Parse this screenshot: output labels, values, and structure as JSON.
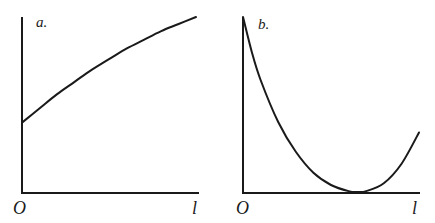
{
  "figure": {
    "background": "#ffffff",
    "ink_color": "#1a1a1a"
  },
  "chart_data": [
    {
      "type": "line",
      "panel_label": "a.",
      "title": "",
      "xlabel": "",
      "ylabel": "",
      "x_tick_labels": [
        "O",
        "l"
      ],
      "xlim": [
        0,
        1
      ],
      "ylim": [
        0,
        1
      ],
      "grid": false,
      "legend": null,
      "description": "Monotonically increasing concave curve starting at y-intercept about 0.4 and rising to about 1.0 at x = 1",
      "series": [
        {
          "name": "curve-a",
          "x": [
            0,
            0.1,
            0.2,
            0.3,
            0.4,
            0.5,
            0.6,
            0.7,
            0.8,
            0.9,
            1.0
          ],
          "y": [
            0.4,
            0.48,
            0.56,
            0.63,
            0.7,
            0.76,
            0.82,
            0.87,
            0.92,
            0.96,
            1.0
          ]
        }
      ]
    },
    {
      "type": "line",
      "panel_label": "b.",
      "title": "",
      "xlabel": "",
      "ylabel": "",
      "x_tick_labels": [
        "O",
        "l"
      ],
      "xlim": [
        0,
        1
      ],
      "ylim": [
        0,
        1
      ],
      "grid": false,
      "legend": null,
      "description": "U-shaped convex curve starting at maximum 1.0 at x = 0, decreasing to a minimum of 0 near x = 0.65, rising to about 0.34 at x = 1",
      "series": [
        {
          "name": "curve-b",
          "x": [
            0,
            0.05,
            0.1,
            0.2,
            0.3,
            0.4,
            0.5,
            0.6,
            0.65,
            0.7,
            0.8,
            0.9,
            1.0
          ],
          "y": [
            1.0,
            0.8,
            0.64,
            0.4,
            0.23,
            0.11,
            0.04,
            0.005,
            0.0,
            0.005,
            0.05,
            0.16,
            0.34
          ]
        }
      ]
    }
  ]
}
